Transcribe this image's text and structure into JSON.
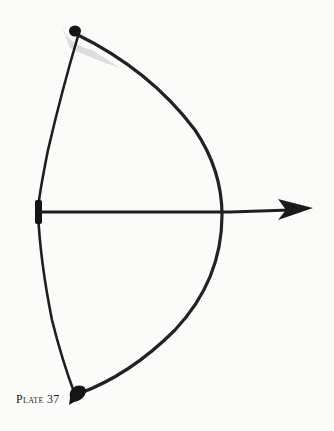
{
  "plate": {
    "caption": "Plate 37"
  },
  "illustration": {
    "subject": "bow-and-arrow",
    "ink_color": "#1e1e1e",
    "shadow_color": "#b8b8b8",
    "paper_color": "#fbfbfa"
  }
}
